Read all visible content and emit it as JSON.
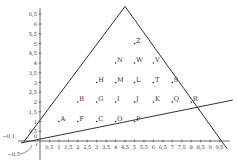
{
  "diagram": {
    "axes": {
      "x_ticks": [
        "0,5",
        "1",
        "1,5",
        "2",
        "2,5",
        "3",
        "3,5",
        "4",
        "4,5",
        "5",
        "5,5",
        "6",
        "6,5",
        "7",
        "7,5",
        "8",
        "8,5",
        "9",
        "9,5"
      ],
      "y_ticks": [
        "0,5",
        "1",
        "1,5",
        "2",
        "2,5",
        "3",
        "3,5",
        "4",
        "4,5",
        "5",
        "5,5",
        "6",
        "6,5"
      ],
      "origin_label": "0",
      "neg_x_label": "−0,1",
      "neg_y_label": "−0,5"
    },
    "points": [
      {
        "label": "A",
        "x": 1.0,
        "y": 1.0
      },
      {
        "label": "F",
        "x": 2.0,
        "y": 1.0
      },
      {
        "label": "C",
        "x": 3.0,
        "y": 1.0
      },
      {
        "label": "O",
        "x": 4.0,
        "y": 1.0
      },
      {
        "label": "P",
        "x": 5.0,
        "y": 1.0
      },
      {
        "label": "B",
        "x": 2.0,
        "y": 2.0
      },
      {
        "label": "G",
        "x": 3.0,
        "y": 2.0
      },
      {
        "label": "I",
        "x": 4.0,
        "y": 2.0
      },
      {
        "label": "J",
        "x": 5.0,
        "y": 2.0
      },
      {
        "label": "K",
        "x": 6.0,
        "y": 2.0
      },
      {
        "label": "Q",
        "x": 7.0,
        "y": 2.0
      },
      {
        "label": "R",
        "x": 8.0,
        "y": 2.0
      },
      {
        "label": "H",
        "x": 3.0,
        "y": 3.0
      },
      {
        "label": "M",
        "x": 4.0,
        "y": 3.0
      },
      {
        "label": "L",
        "x": 5.0,
        "y": 3.0
      },
      {
        "label": "T",
        "x": 6.0,
        "y": 3.0
      },
      {
        "label": "S",
        "x": 7.0,
        "y": 3.0
      },
      {
        "label": "N",
        "x": 4.0,
        "y": 4.0
      },
      {
        "label": "W",
        "x": 5.0,
        "y": 4.0
      },
      {
        "label": "V",
        "x": 6.0,
        "y": 4.0
      },
      {
        "label": "Z",
        "x": 5.0,
        "y": 5.0
      }
    ],
    "lines": [
      {
        "name": "left-line",
        "x1": -0.9,
        "y1": -0.1,
        "x2": 4.5,
        "y2": 6.9
      },
      {
        "name": "right-line",
        "x1": 4.5,
        "y1": 6.9,
        "x2": 9.9,
        "y2": -0.4
      },
      {
        "name": "bottom-line",
        "x1": -1.0,
        "y1": -0.1,
        "x2": 10.2,
        "y2": 2.1
      }
    ]
  }
}
